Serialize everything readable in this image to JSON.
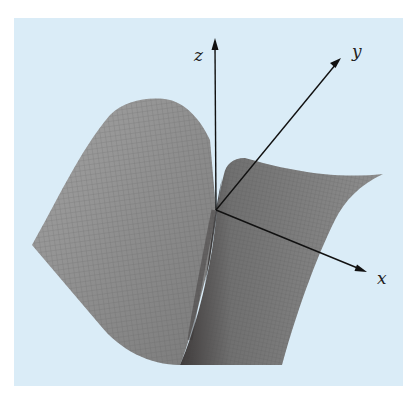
{
  "figure": {
    "type": "3d-surface-plot",
    "background_color": "#daecf7",
    "surface_color": "#8a8a8a",
    "axes": {
      "x": {
        "label": "x"
      },
      "y": {
        "label": "y"
      },
      "z": {
        "label": "z"
      }
    }
  }
}
